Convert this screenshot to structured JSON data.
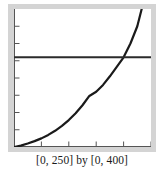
{
  "figure": {
    "caption": "[0, 250] by [0, 400]",
    "background_color": "#ffffff",
    "frame_color": "#d4d4d4",
    "plot_background": "#ffffff"
  },
  "chart_data": {
    "type": "line",
    "title": "",
    "subtitle": "",
    "xlabel": "",
    "ylabel": "",
    "xlim": [
      0,
      250
    ],
    "ylim": [
      0,
      400
    ],
    "grid": false,
    "legend": null,
    "axis_color": "#555555",
    "tick_marks": {
      "x": [
        50,
        100,
        150,
        200,
        250
      ],
      "y": [
        50,
        100,
        150,
        200,
        250,
        300,
        350
      ],
      "x_step": 50,
      "y_step": 50,
      "labels_shown": false
    },
    "annotations": [
      {
        "name": "intersection",
        "x": 200,
        "y": 260,
        "label": ""
      }
    ],
    "series": [
      {
        "name": "exponential-curve",
        "color": "#1a1a1a",
        "width": 2.2,
        "x": [
          0,
          12.5,
          25,
          37.5,
          50,
          62.5,
          75,
          87.5,
          100,
          112.5,
          125,
          137.5,
          150,
          162.5,
          175,
          187.5,
          200,
          212.5,
          225,
          233
        ],
        "y": [
          0,
          4,
          10,
          17,
          25,
          35,
          47,
          61,
          78,
          98,
          121,
          148,
          160,
          180,
          205,
          232,
          260,
          300,
          350,
          400
        ]
      },
      {
        "name": "horizontal-line",
        "color": "#2b2b2b",
        "width": 2.0,
        "x": [
          0,
          250
        ],
        "y": [
          260,
          260
        ]
      }
    ]
  }
}
